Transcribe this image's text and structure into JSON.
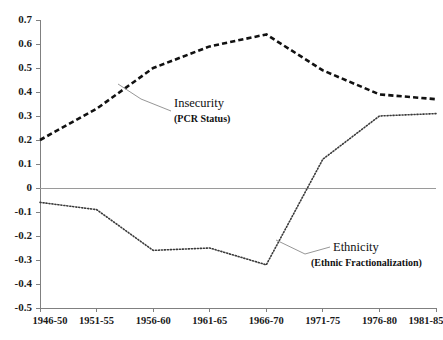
{
  "chart_data": {
    "type": "line",
    "title": "",
    "subtitle": "",
    "xlabel": "",
    "ylabel": "",
    "categories": [
      "1946-50",
      "1951-55",
      "1956-60",
      "1961-65",
      "1966-70",
      "1971-75",
      "1976-80",
      "1981-85"
    ],
    "ylim": [
      -0.5,
      0.7
    ],
    "ytick_labels": [
      "0.7",
      "0.6",
      "0.5",
      "0.4",
      "0.3",
      "0.2",
      "0.1",
      "0",
      "-0.1",
      "-0.2",
      "-0.3",
      "-0.4",
      "-0.5"
    ],
    "ytick_values": [
      0.7,
      0.6,
      0.5,
      0.4,
      0.3,
      0.2,
      0.1,
      0.0,
      -0.1,
      -0.2,
      -0.3,
      -0.4,
      -0.5
    ],
    "grid": false,
    "legend_position": "inline-annotations",
    "zero_line": 0.0,
    "series": [
      {
        "name": "Insecurity",
        "sublabel": "(PCR Status)",
        "style": "dashed",
        "color": "#111111",
        "values": [
          0.2,
          0.33,
          0.5,
          0.59,
          0.64,
          0.49,
          0.39,
          0.37
        ]
      },
      {
        "name": "Ethnicity",
        "sublabel": "(Ethnic Fractionalization)",
        "style": "dotted",
        "color": "#3a3a3a",
        "values": [
          -0.06,
          -0.09,
          -0.26,
          -0.25,
          -0.32,
          0.12,
          0.3,
          0.31
        ]
      }
    ],
    "annotations": [
      {
        "id": "insecurity",
        "title": "Insecurity",
        "subtitle": "(PCR Status)"
      },
      {
        "id": "ethnicity",
        "title": "Ethnicity",
        "subtitle": "(Ethnic Fractionalization)"
      }
    ]
  }
}
